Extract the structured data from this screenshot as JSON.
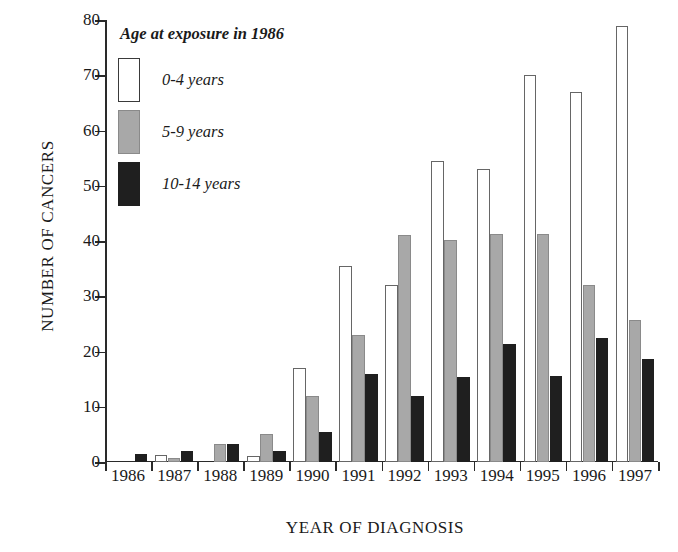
{
  "chart_data": {
    "type": "bar",
    "title": "",
    "xlabel": "YEAR OF DIAGNOSIS",
    "ylabel": "NUMBER OF CANCERS",
    "ylim": [
      0,
      80
    ],
    "yticks": [
      0,
      10,
      20,
      30,
      40,
      50,
      60,
      70,
      80
    ],
    "grid": false,
    "legend_position": "top-left",
    "legend_title": "Age at exposure in 1986",
    "categories": [
      "1986",
      "1987",
      "1988",
      "1989",
      "1990",
      "1991",
      "1992",
      "1993",
      "1994",
      "1995",
      "1996",
      "1997"
    ],
    "series": [
      {
        "name": "0-4 years",
        "color": "#ffffff",
        "values": [
          0,
          1.3,
          0,
          1,
          17,
          35.5,
          32,
          54.5,
          53,
          70,
          67,
          79
        ]
      },
      {
        "name": "5-9 years",
        "color": "#a8a8a8",
        "values": [
          0,
          0.8,
          3.2,
          5,
          12,
          23,
          41,
          40.2,
          41.2,
          41.2,
          32,
          25.7
        ]
      },
      {
        "name": "10-14 years",
        "color": "#1f1f1f",
        "values": [
          1.5,
          2,
          3.2,
          2,
          5.5,
          16,
          12,
          15.3,
          21.3,
          15.5,
          22.5,
          18.6
        ]
      }
    ]
  }
}
